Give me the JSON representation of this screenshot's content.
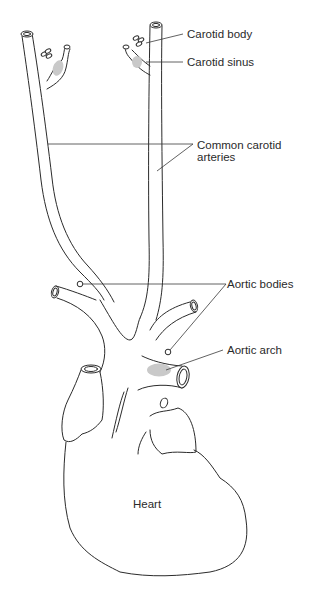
{
  "diagram": {
    "labels": {
      "carotid_body": "Carotid body",
      "carotid_sinus": "Carotid sinus",
      "common_carotid_line1": "Common carotid",
      "common_carotid_line2": "arteries",
      "aortic_bodies": "Aortic bodies",
      "aortic_arch": "Aortic arch",
      "heart": "Heart"
    },
    "colors": {
      "line": "#2b2b2b",
      "shade": "#c9c9c9",
      "text": "#2a2a2a",
      "background": "#ffffff"
    },
    "structures": [
      "left-common-carotid-artery",
      "right-common-carotid-artery",
      "left-carotid-bifurcation",
      "right-carotid-bifurcation",
      "aortic-arch",
      "brachiocephalic-trunk",
      "subclavian-artery",
      "heart"
    ]
  }
}
